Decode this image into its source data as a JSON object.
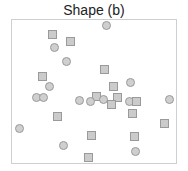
{
  "figure": {
    "title": "Shape (b)",
    "colors": {
      "marker_fill": "#cbcbcb",
      "marker_stroke": "#9a9a9a",
      "frame": "#cfcfcf"
    },
    "markers": [
      {
        "shape": "circle",
        "x": 106,
        "y": 25
      },
      {
        "shape": "square",
        "x": 52,
        "y": 34
      },
      {
        "shape": "square",
        "x": 70,
        "y": 41
      },
      {
        "shape": "circle",
        "x": 54,
        "y": 47
      },
      {
        "shape": "circle",
        "x": 66,
        "y": 61
      },
      {
        "shape": "square",
        "x": 104,
        "y": 69
      },
      {
        "shape": "square",
        "x": 42,
        "y": 76
      },
      {
        "shape": "circle",
        "x": 130,
        "y": 82
      },
      {
        "shape": "square",
        "x": 113,
        "y": 86
      },
      {
        "shape": "circle",
        "x": 49,
        "y": 86
      },
      {
        "shape": "square",
        "x": 96,
        "y": 96
      },
      {
        "shape": "circle",
        "x": 36,
        "y": 97
      },
      {
        "shape": "circle",
        "x": 43,
        "y": 97
      },
      {
        "shape": "square",
        "x": 117,
        "y": 97
      },
      {
        "shape": "circle",
        "x": 79,
        "y": 100
      },
      {
        "shape": "circle",
        "x": 90,
        "y": 101
      },
      {
        "shape": "circle",
        "x": 103,
        "y": 99
      },
      {
        "shape": "circle",
        "x": 129,
        "y": 101
      },
      {
        "shape": "square",
        "x": 136,
        "y": 101
      },
      {
        "shape": "circle",
        "x": 169,
        "y": 99
      },
      {
        "shape": "square",
        "x": 111,
        "y": 104
      },
      {
        "shape": "square",
        "x": 132,
        "y": 113
      },
      {
        "shape": "square",
        "x": 57,
        "y": 116
      },
      {
        "shape": "square",
        "x": 164,
        "y": 123
      },
      {
        "shape": "circle",
        "x": 19,
        "y": 128
      },
      {
        "shape": "square",
        "x": 91,
        "y": 135
      },
      {
        "shape": "square",
        "x": 134,
        "y": 136
      },
      {
        "shape": "circle",
        "x": 63,
        "y": 145
      },
      {
        "shape": "circle",
        "x": 135,
        "y": 151
      },
      {
        "shape": "square",
        "x": 88,
        "y": 157
      }
    ]
  }
}
